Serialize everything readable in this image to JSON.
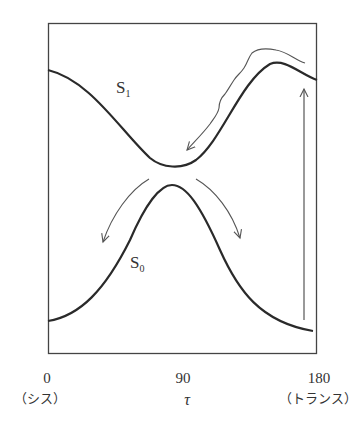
{
  "diagram": {
    "curves": {
      "s1_label": "S",
      "s1_sub": "1",
      "s0_label": "S",
      "s0_sub": "0"
    },
    "axis": {
      "ticks": [
        {
          "value": "0",
          "note": "（シス）"
        },
        {
          "value": "90",
          "note": "τ"
        },
        {
          "value": "180",
          "note": "（トランス）"
        }
      ]
    },
    "colors": {
      "curve": "#2a2a2a",
      "arrow": "#555555",
      "frame": "#444444"
    }
  }
}
